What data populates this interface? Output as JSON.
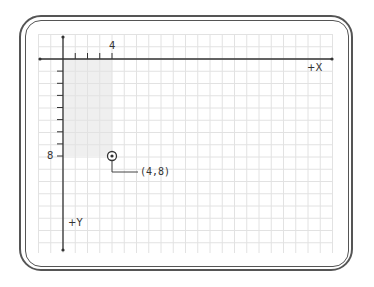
{
  "diagram": {
    "type": "coordinate-plane",
    "axes": {
      "x_label": "+X",
      "y_label": "+Y",
      "x_tick_label": "4",
      "y_tick_label": "8"
    },
    "point": {
      "x": 4,
      "y": 8,
      "label": "(4,8)"
    },
    "colors": {
      "grid": "#e3e3e3",
      "axis": "#333333",
      "highlight": "#f0f0f0",
      "frame": "#555555"
    }
  }
}
